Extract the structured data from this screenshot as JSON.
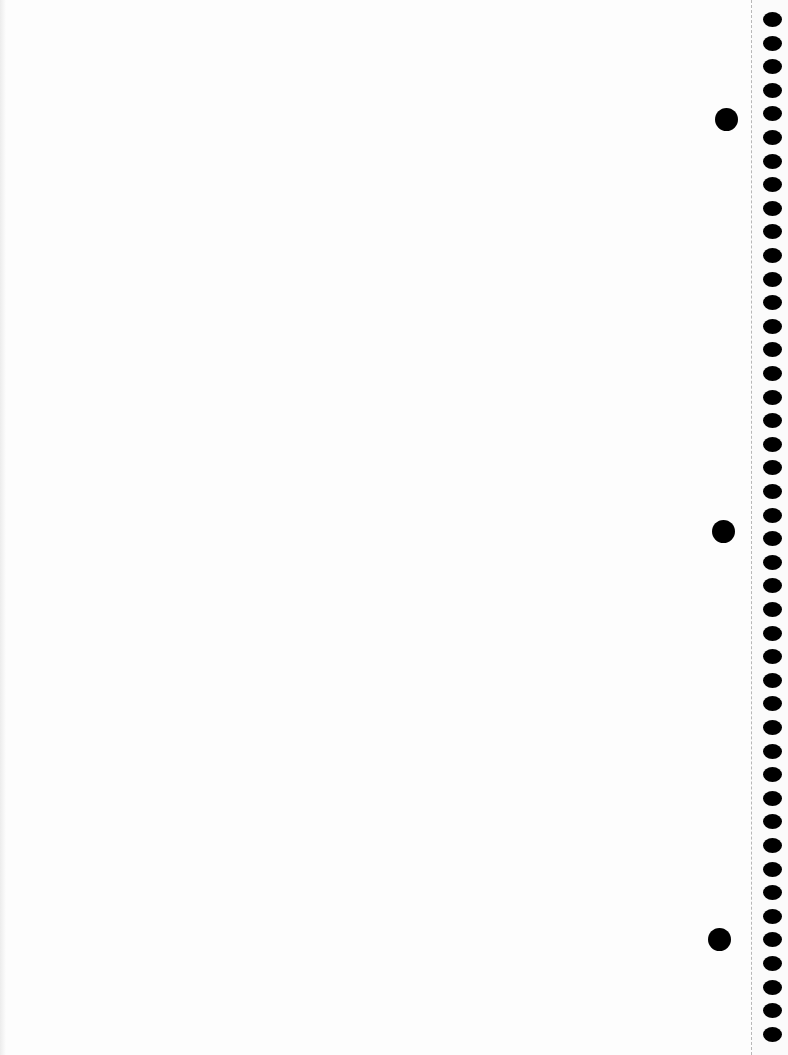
{
  "page": {
    "type": "blank notebook page",
    "background_color": "#fdfdfd",
    "hole_color": "#000000",
    "perforation_x": 751
  },
  "binding_holes": {
    "count": 44,
    "left": 763,
    "first_top": 12,
    "spacing": 23.6,
    "width": 19,
    "height": 15
  },
  "punch_holes": [
    {
      "cx": 726,
      "cy": 119
    },
    {
      "cx": 723,
      "cy": 531
    },
    {
      "cx": 719,
      "cy": 939
    }
  ]
}
